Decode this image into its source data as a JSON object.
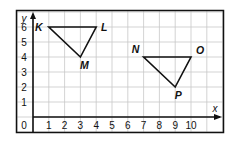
{
  "figure": {
    "x_axis_label": "x",
    "y_axis_label": "y",
    "origin_label": "0",
    "x_ticks": [
      "1",
      "2",
      "3",
      "4",
      "5",
      "6",
      "7",
      "8",
      "9",
      "10"
    ],
    "y_ticks": [
      "1",
      "2",
      "3",
      "4",
      "5",
      "6"
    ],
    "triangles": [
      {
        "name": "KLM",
        "points": [
          {
            "label": "K",
            "x": 1,
            "y": 6
          },
          {
            "label": "L",
            "x": 4,
            "y": 6
          },
          {
            "label": "M",
            "x": 3,
            "y": 4
          }
        ]
      },
      {
        "name": "NOP",
        "points": [
          {
            "label": "N",
            "x": 7,
            "y": 4
          },
          {
            "label": "O",
            "x": 10,
            "y": 4
          },
          {
            "label": "P",
            "x": 9,
            "y": 2
          }
        ]
      }
    ],
    "colors": {
      "grid": "#c8c8c8",
      "ink": "#111111"
    }
  }
}
